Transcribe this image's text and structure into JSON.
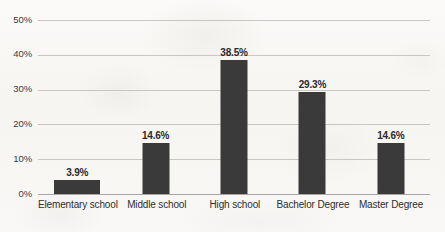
{
  "chart_data": {
    "type": "bar",
    "title": "",
    "subtitle": "",
    "xlabel": "",
    "ylabel": "",
    "categories": [
      "Elementary school",
      "Middle school",
      "High school",
      "Bachelor Degree",
      "Master Degree"
    ],
    "values": [
      3.9,
      14.6,
      38.5,
      29.3,
      14.6
    ],
    "data_labels": [
      "3.9%",
      "14.6%",
      "38.5%",
      "29.3%",
      "14.6%"
    ],
    "ylim": [
      0,
      50
    ],
    "ytick_values": [
      0,
      10,
      20,
      30,
      40,
      50
    ],
    "ytick_labels": [
      "0%",
      "10%",
      "20%",
      "30%",
      "40%",
      "50%"
    ],
    "grid": true,
    "legend": false,
    "legend_position": "none",
    "bar_color": "#3a3a3a",
    "gridline_color": "#c9c7c3",
    "axis_color": "#a9a7a3",
    "background_color": "#f8f7f5",
    "text_color": "#2e2e2e"
  }
}
